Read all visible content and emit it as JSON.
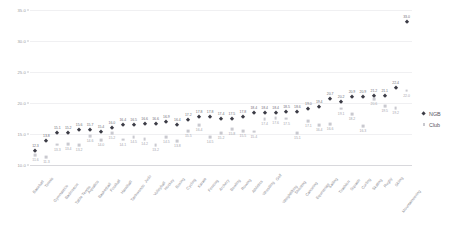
{
  "chart_data": {
    "type": "scatter",
    "title": "",
    "subtitle": "",
    "xlabel": "",
    "ylabel": "",
    "ylim": [
      10.0,
      35.0
    ],
    "yticks": [
      "35.0",
      "30.0",
      "25.0",
      "20.0",
      "15.0",
      "10.0"
    ],
    "ytick_values": [
      35.0,
      30.0,
      25.0,
      20.0,
      15.0,
      10.0
    ],
    "grid": true,
    "legend_position": "right",
    "legend": [
      "NGB",
      "Club"
    ],
    "categories": [
      "Baseball",
      "Tennis",
      "Gymnastics",
      "Badminton",
      "Table Tennis",
      "Aquatics",
      "Basketball",
      "Football",
      "Handball",
      "Taekwondo",
      "Judo",
      "Volleyball",
      "Hockey",
      "Boxing",
      "Cycling",
      "Karate",
      "Fencing",
      "Archery",
      "Bowling",
      "Rowing",
      "Athletics",
      "Wrestling",
      "Golf",
      "Weightlifting",
      "Shooting",
      "Canoeing",
      "Equestrian",
      "Sailing",
      "Triathlon",
      "Squash",
      "Curling",
      "Skating",
      "Rugby",
      "Skiing",
      "Mountaineering"
    ],
    "series": [
      {
        "name": "NGB",
        "marker": "diamond",
        "color": "#3c3c46",
        "values": [
          12.3,
          13.8,
          15.1,
          15.2,
          15.6,
          15.7,
          15.4,
          16.0,
          16.4,
          16.5,
          16.6,
          16.6,
          16.9,
          16.4,
          17.2,
          17.8,
          17.8,
          17.4,
          17.5,
          17.8,
          18.4,
          18.4,
          18.4,
          18.5,
          18.6,
          19.0,
          19.4,
          20.7,
          20.2,
          20.9,
          20.9,
          21.2,
          21.1,
          22.4,
          33.0
        ],
        "labels": [
          "12.3",
          "13.8",
          "15.1",
          "15.2",
          "15.6",
          "15.7",
          "15.4",
          "16.0",
          "16.4",
          "16.5",
          "16.6",
          "16.6",
          "16.9",
          "16.4",
          "17.2",
          "17.8",
          "17.8",
          "17.4",
          "17.5",
          "17.8",
          "18.4",
          "18.4",
          "18.4",
          "18.5",
          "18.6",
          "19.0",
          "19.4",
          "20.7",
          "20.2",
          "20.9",
          "20.9",
          "21.2",
          "21.1",
          "22.4",
          "33.0"
        ]
      },
      {
        "name": "Club",
        "marker": "square",
        "color": "#c9c9cf",
        "values": [
          11.6,
          11.3,
          13.3,
          13.4,
          13.2,
          14.6,
          14.0,
          15.2,
          14.1,
          14.5,
          14.2,
          13.2,
          14.5,
          13.8,
          15.5,
          16.4,
          14.5,
          15.2,
          15.8,
          15.5,
          15.4,
          17.4,
          17.6,
          17.5,
          15.1,
          17.1,
          16.4,
          16.6,
          19.1,
          18.2,
          16.3,
          20.6,
          19.5,
          19.2,
          22.0
        ],
        "labels": [
          "11.6",
          "11.3",
          "13.3",
          "13.4",
          "13.2",
          "14.6",
          "14.0",
          "15.2",
          "14.1",
          "14.5",
          "14.2",
          "13.2",
          "14.5",
          "13.8",
          "15.5",
          "16.4",
          "14.5",
          "15.2",
          "15.8",
          "15.5",
          "15.4",
          "17.4",
          "17.6",
          "17.5",
          "15.1",
          "17.1",
          "16.4",
          "16.6",
          "19.1",
          "18.2",
          "16.3",
          "20.6",
          "19.5",
          "19.2",
          "22.0"
        ]
      }
    ]
  }
}
